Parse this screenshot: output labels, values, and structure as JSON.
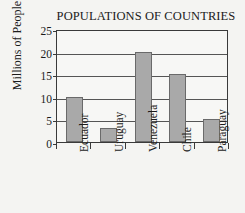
{
  "chart_data": {
    "type": "bar",
    "title": "POPULATIONS OF COUNTRIES",
    "xlabel": "",
    "ylabel": "Millions of People",
    "categories": [
      "Ecuador",
      "Uruguay",
      "Venezuela",
      "Chile",
      "Paraguay"
    ],
    "values": [
      10,
      3,
      20,
      15,
      5
    ],
    "ylim": [
      0,
      25
    ],
    "yticks": [
      0,
      5,
      10,
      15,
      20,
      25
    ],
    "ytick_labels": [
      "0",
      "5",
      "10",
      "15",
      "20",
      "25"
    ],
    "grid": true,
    "legend": false,
    "bar_color": "#a9a9a9",
    "bar_edge_color": "#6a6a6a",
    "axis_color": "#3a3a3a",
    "grid_color": "#555555",
    "background_color": "#f4f4f2"
  }
}
